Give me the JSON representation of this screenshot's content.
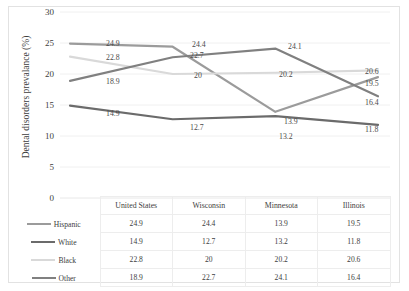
{
  "axis": {
    "y_title": "Dental disorders prevalance (%)",
    "y_ticks": [
      "30",
      "25",
      "20",
      "15",
      "10",
      "5",
      "0"
    ]
  },
  "ghost_title": "",
  "legend": [
    {
      "label": "Hispanic",
      "color": "#9b9b9b"
    },
    {
      "label": "White",
      "color": "#6b6b6b"
    },
    {
      "label": "Black",
      "color": "#d9d9d9"
    },
    {
      "label": "Other",
      "color": "#808080"
    }
  ],
  "table": {
    "headers": [
      "",
      "United States",
      "Wisconsin",
      "Minnesota",
      "Illinois"
    ],
    "rows": [
      {
        "name": "Hispanic",
        "values": [
          "24.9",
          "24.4",
          "13.9",
          "19.5"
        ]
      },
      {
        "name": "White",
        "values": [
          "14.9",
          "12.7",
          "13.2",
          "11.8"
        ]
      },
      {
        "name": "Black",
        "values": [
          "22.8",
          "20",
          "20.2",
          "20.6"
        ]
      },
      {
        "name": "Other",
        "values": [
          "18.9",
          "22.7",
          "24.1",
          "16.4"
        ]
      }
    ]
  },
  "chart_data": {
    "type": "line",
    "title": "",
    "xlabel": "",
    "ylabel": "Dental disorders prevalance (%)",
    "ylim": [
      0,
      30
    ],
    "yticks": [
      0,
      5,
      10,
      15,
      20,
      25,
      30
    ],
    "grid": true,
    "legend_position": "table-below",
    "categories": [
      "United States",
      "Wisconsin",
      "Minnesota",
      "Illinois"
    ],
    "series": [
      {
        "name": "Hispanic",
        "color": "#9b9b9b",
        "values": [
          24.9,
          24.4,
          13.9,
          19.5
        ]
      },
      {
        "name": "White",
        "color": "#6b6b6b",
        "values": [
          14.9,
          12.7,
          13.2,
          11.8
        ]
      },
      {
        "name": "Black",
        "color": "#d9d9d9",
        "values": [
          22.8,
          20.0,
          20.2,
          20.6
        ]
      },
      {
        "name": "Other",
        "color": "#808080",
        "values": [
          18.9,
          22.7,
          24.1,
          16.4
        ]
      }
    ],
    "point_labels": [
      {
        "series": "Hispanic",
        "category": "United States",
        "text": "24.9",
        "x": 46,
        "y": 38
      },
      {
        "series": "Hispanic",
        "category": "Wisconsin",
        "text": "24.4",
        "x": 132,
        "y": 39
      },
      {
        "series": "Hispanic",
        "category": "Minnesota",
        "text": "13.9",
        "x": 224,
        "y": 116
      },
      {
        "series": "Hispanic",
        "category": "Illinois",
        "text": "19.5",
        "x": 305,
        "y": 78
      },
      {
        "series": "White",
        "category": "United States",
        "text": "14.9",
        "x": 46,
        "y": 108
      },
      {
        "series": "White",
        "category": "Wisconsin",
        "text": "12.7",
        "x": 130,
        "y": 122
      },
      {
        "series": "White",
        "category": "Minnesota",
        "text": "13.2",
        "x": 219,
        "y": 131
      },
      {
        "series": "White",
        "category": "Illinois",
        "text": "11.8",
        "x": 305,
        "y": 124
      },
      {
        "series": "Black",
        "category": "United States",
        "text": "22.8",
        "x": 46,
        "y": 52
      },
      {
        "series": "Black",
        "category": "Wisconsin",
        "text": "20",
        "x": 134,
        "y": 70
      },
      {
        "series": "Black",
        "category": "Minnesota",
        "text": "20.2",
        "x": 219,
        "y": 69
      },
      {
        "series": "Black",
        "category": "Illinois",
        "text": "20.6",
        "x": 305,
        "y": 66
      },
      {
        "series": "Other",
        "category": "United States",
        "text": "18.9",
        "x": 46,
        "y": 76
      },
      {
        "series": "Other",
        "category": "Wisconsin",
        "text": "22.7",
        "x": 130,
        "y": 50
      },
      {
        "series": "Other",
        "category": "Minnesota",
        "text": "24.1",
        "x": 228,
        "y": 41
      },
      {
        "series": "Other",
        "category": "Illinois",
        "text": "16.4",
        "x": 305,
        "y": 97
      }
    ]
  }
}
